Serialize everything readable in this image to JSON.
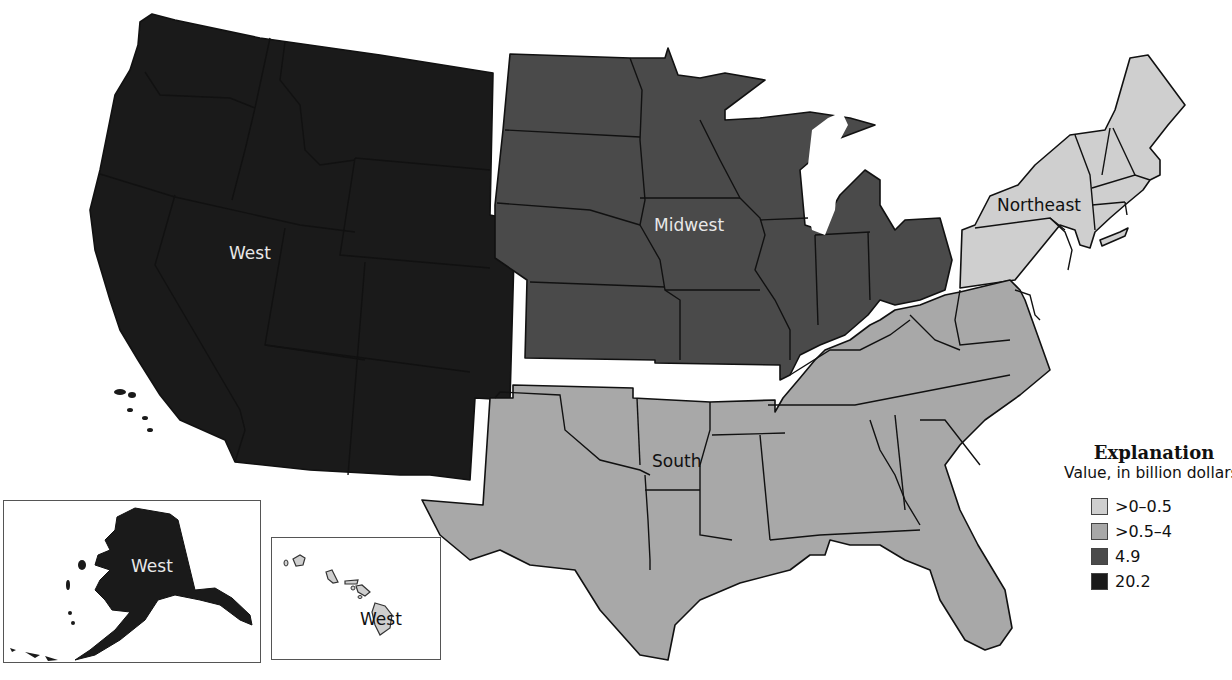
{
  "map": {
    "type": "choropleth",
    "subject": "United States by census region",
    "regions": [
      {
        "name": "West",
        "class_label": "20.2",
        "color": "#1a1a1a"
      },
      {
        "name": "Midwest",
        "class_label": "4.9",
        "color": "#4a4a4a"
      },
      {
        "name": "South",
        "class_label": ">0.5–4",
        "color": "#a8a8a8"
      },
      {
        "name": "Northeast",
        "class_label": ">0–0.5",
        "color": "#cfcfcf"
      }
    ],
    "labels": {
      "west": "West",
      "midwest": "Midwest",
      "south": "South",
      "northeast": "Northeast",
      "alaska": "West",
      "hawaii": "West"
    },
    "insets": [
      {
        "name": "Alaska",
        "region": "West"
      },
      {
        "name": "Hawaii",
        "region": "West"
      }
    ]
  },
  "legend": {
    "title": "Explanation",
    "subtitle": "Value, in billion dollars",
    "items": [
      {
        "label": ">0–0.5",
        "color": "#cfcfcf"
      },
      {
        "label": ">0.5–4",
        "color": "#a8a8a8"
      },
      {
        "label": "4.9",
        "color": "#4a4a4a"
      },
      {
        "label": "20.2",
        "color": "#1a1a1a"
      }
    ]
  },
  "colors": {
    "west": "#1a1a1a",
    "midwest": "#4a4a4a",
    "south": "#a8a8a8",
    "northeast": "#cfcfcf",
    "hawaii": "#cfcfcf",
    "outline": "#111111",
    "background": "#ffffff"
  }
}
